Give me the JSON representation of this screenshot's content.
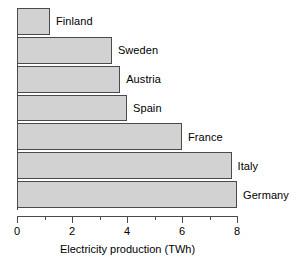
{
  "chart_data": {
    "type": "bar",
    "orientation": "horizontal",
    "title": "",
    "xlabel": "Electricity production (TWh)",
    "ylabel": "",
    "xlim": [
      0,
      8
    ],
    "x_major_ticks": [
      0,
      2,
      4,
      6,
      8
    ],
    "x_minor_ticks": [
      1,
      3,
      5,
      7
    ],
    "x_tick_labels": [
      "0",
      "2",
      "4",
      "6",
      "8"
    ],
    "grid": false,
    "legend": false,
    "bar_fill_color": "#d2d2d2",
    "bar_edge_color": "#4a4a4a",
    "categories": [
      "Finland",
      "Sweden",
      "Austria",
      "Spain",
      "France",
      "Italy",
      "Germany"
    ],
    "values": [
      1.2,
      3.45,
      3.75,
      4.0,
      6.0,
      7.8,
      8.0
    ],
    "bars": [
      {
        "label": "Finland",
        "value": 1.2
      },
      {
        "label": "Sweden",
        "value": 3.45
      },
      {
        "label": "Austria",
        "value": 3.75
      },
      {
        "label": "Spain",
        "value": 4.0
      },
      {
        "label": "France",
        "value": 6.0
      },
      {
        "label": "Italy",
        "value": 7.8
      },
      {
        "label": "Germany",
        "value": 8.0
      }
    ]
  }
}
